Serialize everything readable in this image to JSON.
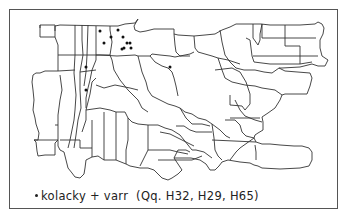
{
  "legend": {
    "symbol": "dot",
    "text": "kolacky + varr",
    "refs": "(Qq. H32, H29, H65)"
  },
  "map": {
    "frame": {
      "x": 9,
      "y": 9,
      "w": 329,
      "h": 200
    },
    "outline_color": "#333333",
    "dot_color": "#111111",
    "dot_radius": 1.5,
    "dots": [
      {
        "x": 100,
        "y": 31
      },
      {
        "x": 118,
        "y": 30
      },
      {
        "x": 111,
        "y": 37
      },
      {
        "x": 104,
        "y": 43
      },
      {
        "x": 123,
        "y": 37
      },
      {
        "x": 127,
        "y": 43
      },
      {
        "x": 130,
        "y": 43
      },
      {
        "x": 124,
        "y": 48
      },
      {
        "x": 131,
        "y": 48
      },
      {
        "x": 122,
        "y": 49
      },
      {
        "x": 86,
        "y": 67
      },
      {
        "x": 86,
        "y": 90
      },
      {
        "x": 170,
        "y": 67
      }
    ]
  }
}
